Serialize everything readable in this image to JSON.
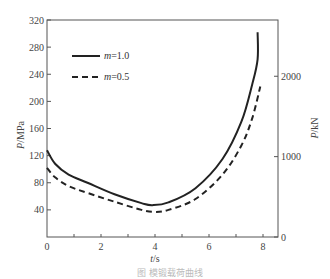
{
  "chart_data": {
    "type": "line",
    "title": "",
    "caption": "图  模锻载荷曲线",
    "xlabel": "t/s",
    "ylabel": "P/MPa",
    "y2label": "P/kN",
    "xlim": [
      0,
      8.6
    ],
    "ylim": [
      0,
      320
    ],
    "y2lim": [
      0,
      2700
    ],
    "xticks": [
      "0",
      "2",
      "4",
      "6",
      "8"
    ],
    "yticks": [
      "40",
      "80",
      "120",
      "160",
      "200",
      "240",
      "280",
      "320"
    ],
    "y2ticks": [
      "0",
      "1000",
      "2000"
    ],
    "grid": false,
    "legend_position": "upper-left",
    "series": [
      {
        "name": "m=1.0",
        "style": "solid",
        "x": [
          0,
          0.3,
          0.8,
          1.5,
          2.5,
          3.5,
          3.9,
          4.5,
          5.5,
          6.5,
          7.2,
          7.6,
          7.8,
          7.8
        ],
        "values": [
          128,
          108,
          92,
          80,
          63,
          50,
          47,
          51,
          72,
          115,
          170,
          225,
          262,
          302
        ]
      },
      {
        "name": "m=0.5",
        "style": "dashed",
        "x": [
          0,
          0.3,
          0.8,
          1.5,
          2.5,
          3.5,
          4.0,
          4.5,
          5.5,
          6.5,
          7.2,
          7.6,
          7.9
        ],
        "values": [
          102,
          88,
          75,
          65,
          52,
          40,
          37,
          40,
          56,
          92,
          135,
          175,
          222
        ]
      }
    ]
  },
  "legend": {
    "items": [
      {
        "var": "m",
        "value": "=1.0"
      },
      {
        "var": "m",
        "value": "=0.5"
      }
    ]
  },
  "axes": {
    "x_label_var": "t",
    "x_label_unit": "/s",
    "y_label_var": "P",
    "y_label_unit": "/MPa",
    "y2_label_var": "P",
    "y2_label_unit": "/kN"
  }
}
